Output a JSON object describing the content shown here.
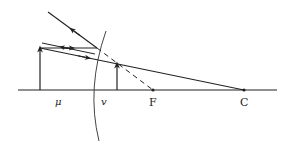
{
  "diagram": {
    "type": "ray-diagram-convex-mirror",
    "labels": {
      "object_distance": "μ",
      "image_distance": "v",
      "focus": "F",
      "center": "C"
    },
    "colors": {
      "line": "#222222",
      "background": "#ffffff"
    }
  }
}
